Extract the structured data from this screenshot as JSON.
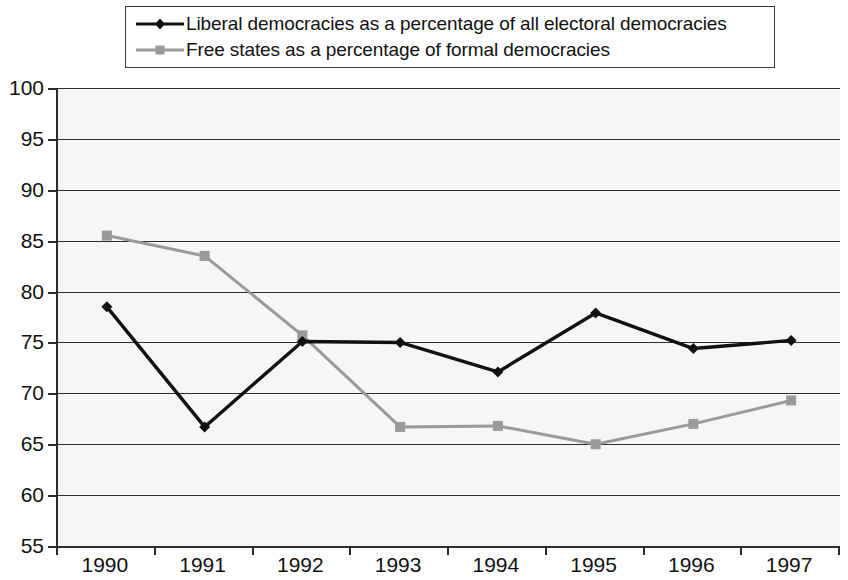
{
  "chart_data": {
    "type": "line",
    "title": "",
    "subtitle": "",
    "xlabel": "",
    "ylabel": "",
    "categories": [
      "1990",
      "1991",
      "1992",
      "1993",
      "1994",
      "1995",
      "1996",
      "1997"
    ],
    "x": [
      1990,
      1991,
      1992,
      1993,
      1994,
      1995,
      1996,
      1997
    ],
    "ylim": [
      55,
      100
    ],
    "yticks": [
      55,
      60,
      65,
      70,
      75,
      80,
      85,
      90,
      95,
      100
    ],
    "ytick_labels": [
      "55",
      "60",
      "65",
      "70",
      "75",
      "80",
      "85",
      "90",
      "95",
      "100"
    ],
    "grid": true,
    "legend_position": "top",
    "series": [
      {
        "name": "Liberal democracies as a percentage of all electoral democracies",
        "color": "#111111",
        "marker": "diamond",
        "values": [
          78.5,
          66.7,
          75.1,
          75.0,
          72.1,
          77.9,
          74.4,
          75.2
        ]
      },
      {
        "name": "Free states as a percentage of formal democracies",
        "color": "#9a9a9a",
        "marker": "square",
        "values": [
          85.5,
          83.5,
          75.7,
          66.7,
          66.8,
          65.0,
          67.0,
          69.3
        ]
      }
    ]
  },
  "legend": {
    "entries": [
      {
        "label": "Liberal democracies as a percentage of all electoral democracies"
      },
      {
        "label": "Free states as a percentage of formal democracies"
      }
    ]
  },
  "colors": {
    "series_1": "#111111",
    "series_2": "#9a9a9a",
    "axis": "#2b2b2b",
    "grid": "#2e2e2e",
    "plot_background": "#f6f6f4",
    "page_background": "#ffffff"
  }
}
